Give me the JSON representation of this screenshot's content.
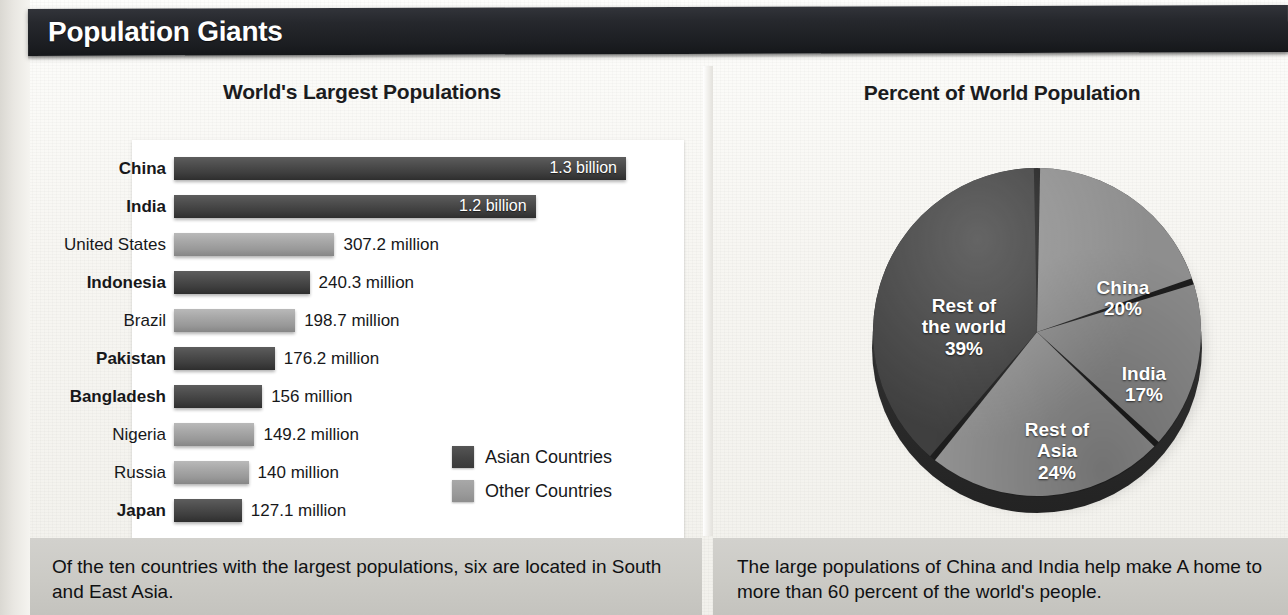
{
  "banner": {
    "title": "Population Giants"
  },
  "left_panel": {
    "title": "World's Largest Populations",
    "legend": [
      {
        "label": "Asian Countries",
        "swatch": "asian",
        "color": "#434343"
      },
      {
        "label": "Other Countries",
        "swatch": "other",
        "color": "#9a9a9a"
      }
    ],
    "caption": "Of the ten countries with the largest populations, six are located in South and East Asia."
  },
  "right_panel": {
    "title": "Percent of World Population",
    "caption": "The large populations of China and India help make A home to more than 60 percent of the world's people."
  },
  "chart_data": [
    {
      "type": "bar",
      "title": "World's Largest Populations",
      "orientation": "horizontal",
      "xlabel": "",
      "ylabel": "",
      "grid": false,
      "legend_position": "inside-right",
      "categories": [
        "China",
        "India",
        "United States",
        "Indonesia",
        "Brazil",
        "Pakistan",
        "Bangladesh",
        "Nigeria",
        "Russia",
        "Japan"
      ],
      "values": [
        1300,
        1200,
        307.2,
        240.3,
        198.7,
        176.2,
        156,
        149.2,
        140,
        127.1
      ],
      "value_unit": "millions",
      "bars": [
        {
          "country": "China",
          "value_label": "1.3 billion",
          "value": 1300,
          "group": "asian",
          "label_position": "inside",
          "bar_pct": 100.0
        },
        {
          "country": "India",
          "value_label": "1.2 billion",
          "value": 1200,
          "group": "asian",
          "label_position": "inside",
          "bar_pct": 80.0
        },
        {
          "country": "United States",
          "value_label": "307.2 million",
          "value": 307.2,
          "group": "other",
          "label_position": "outside",
          "bar_pct": 35.5
        },
        {
          "country": "Indonesia",
          "value_label": "240.3 million",
          "value": 240.3,
          "group": "asian",
          "label_position": "outside",
          "bar_pct": 30.0
        },
        {
          "country": "Brazil",
          "value_label": "198.7 million",
          "value": 198.7,
          "group": "other",
          "label_position": "outside",
          "bar_pct": 26.8
        },
        {
          "country": "Pakistan",
          "value_label": "176.2 million",
          "value": 176.2,
          "group": "asian",
          "label_position": "outside",
          "bar_pct": 22.3
        },
        {
          "country": "Bangladesh",
          "value_label": "156 million",
          "value": 156,
          "group": "asian",
          "label_position": "outside",
          "bar_pct": 19.5
        },
        {
          "country": "Nigeria",
          "value_label": "149.2 million",
          "value": 149.2,
          "group": "other",
          "label_position": "outside",
          "bar_pct": 17.8
        },
        {
          "country": "Russia",
          "value_label": "140 million",
          "value": 140,
          "group": "other",
          "label_position": "outside",
          "bar_pct": 16.5
        },
        {
          "country": "Japan",
          "value_label": "127.1 million",
          "value": 127.1,
          "group": "asian",
          "label_position": "outside",
          "bar_pct": 15.0
        }
      ]
    },
    {
      "type": "pie",
      "title": "Percent of World Population",
      "start_angle_deg": 0,
      "direction": "clockwise",
      "slices": [
        {
          "name": "China",
          "pct": 20,
          "pct_label": "20%",
          "color": "#8e8e8e"
        },
        {
          "name": "India",
          "pct": 17,
          "pct_label": "17%",
          "color": "#8a8a8a"
        },
        {
          "name": "Rest of Asia",
          "pct": 24,
          "pct_label": "24%",
          "color": "#939393"
        },
        {
          "name": "Rest of the world",
          "pct": 39,
          "pct_label": "39%",
          "color": "#3f3f3f"
        }
      ]
    }
  ]
}
